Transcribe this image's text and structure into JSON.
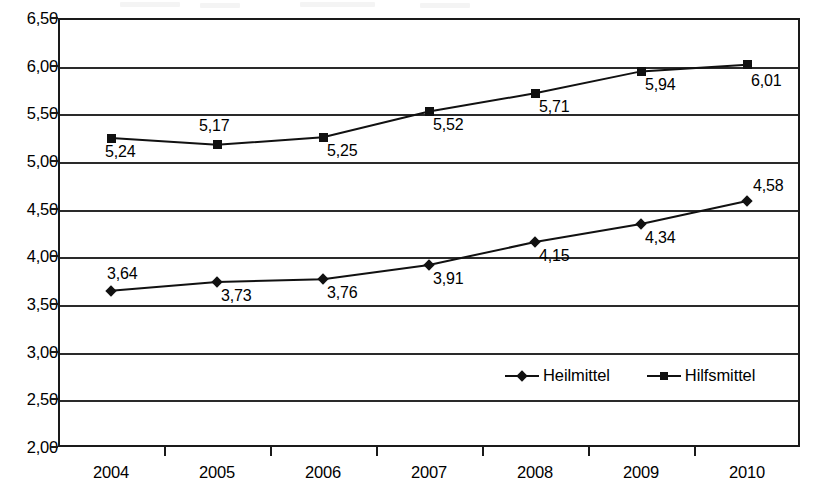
{
  "chart_data": {
    "type": "line",
    "title": "",
    "xlabel": "",
    "ylabel": "",
    "categories": [
      "2004",
      "2005",
      "2006",
      "2007",
      "2008",
      "2009",
      "2010"
    ],
    "ylim": [
      2.0,
      6.5
    ],
    "ytick_step": 0.5,
    "ytick_labels": [
      "6,50",
      "6,00",
      "5,50",
      "5,00",
      "4,50",
      "4,00",
      "3,50",
      "3,00",
      "2,50",
      "2,00"
    ],
    "ytick_values": [
      6.5,
      6.0,
      5.5,
      5.0,
      4.5,
      4.0,
      3.5,
      3.0,
      2.5,
      2.0
    ],
    "grid": true,
    "legend_position": "inside-bottom-right",
    "decimal_separator": ",",
    "series": [
      {
        "name": "Heilmittel",
        "marker": "diamond",
        "color": "#111111",
        "values": [
          3.64,
          3.73,
          3.76,
          3.91,
          4.15,
          4.34,
          4.58
        ],
        "labels": [
          "3,64",
          "3,73",
          "3,76",
          "3,91",
          "4,15",
          "4,34",
          "4,58"
        ],
        "label_positions": [
          "above-right",
          "below-right",
          "below-right",
          "below-right",
          "below-right",
          "below-right",
          "above-right"
        ]
      },
      {
        "name": "Hilfsmittel",
        "marker": "square",
        "color": "#111111",
        "values": [
          5.24,
          5.17,
          5.25,
          5.52,
          5.71,
          5.94,
          6.01
        ],
        "labels": [
          "5,24",
          "5,17",
          "5,25",
          "5,52",
          "5,71",
          "5,94",
          "6,01"
        ],
        "label_positions": [
          "below-right",
          "above-right",
          "below-right",
          "below-right",
          "below-right",
          "below-right",
          "below-right"
        ]
      }
    ]
  },
  "legend": {
    "items": [
      {
        "label": "Heilmittel",
        "marker": "diamond"
      },
      {
        "label": "Hilfsmittel",
        "marker": "square"
      }
    ]
  }
}
